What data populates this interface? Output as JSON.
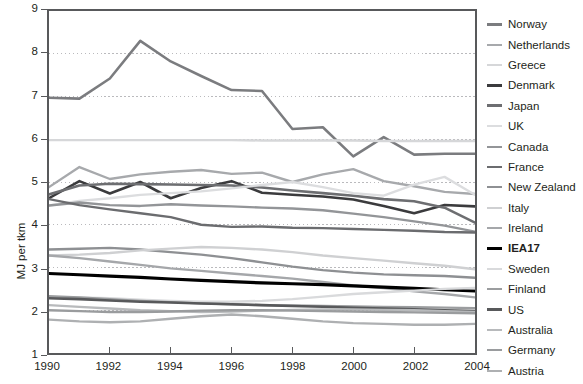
{
  "chart_data": {
    "type": "line",
    "title": "",
    "xlabel": "",
    "ylabel": "MJ per tkm",
    "xlim": [
      1990,
      2004
    ],
    "ylim": [
      1,
      9
    ],
    "grid": true,
    "legend_position": "right",
    "x": [
      1990,
      1991,
      1992,
      1993,
      1994,
      1995,
      1996,
      1997,
      1998,
      1999,
      2000,
      2001,
      2002,
      2003,
      2004
    ],
    "y_ticks": [
      1,
      2,
      3,
      4,
      5,
      6,
      7,
      8,
      9
    ],
    "x_ticks": [
      1990,
      1992,
      1994,
      1996,
      1998,
      2000,
      2002,
      2004
    ],
    "series": [
      {
        "name": "Norway",
        "color": "#7b7c7f",
        "width": 2.6,
        "values": [
          6.97,
          6.95,
          7.42,
          8.3,
          7.82,
          7.48,
          7.15,
          7.13,
          6.24,
          6.28,
          5.6,
          6.05,
          5.64,
          5.66,
          5.66
        ]
      },
      {
        "name": "Netherlands",
        "color": "#a7a9ac",
        "width": 2.4,
        "values": [
          4.88,
          5.35,
          5.07,
          5.18,
          5.24,
          5.28,
          5.19,
          5.22,
          5.0,
          5.18,
          5.3,
          5.02,
          4.9,
          4.77,
          4.72
        ]
      },
      {
        "name": "Greece",
        "color": "#d6d7d9",
        "width": 2.4,
        "values": [
          5.98,
          5.98,
          5.98,
          5.98,
          5.98,
          5.98,
          5.98,
          5.97,
          5.97,
          5.97,
          5.97,
          5.96,
          5.96,
          5.96,
          5.96
        ]
      },
      {
        "name": "Denmark",
        "color": "#3b3b3d",
        "width": 2.6,
        "values": [
          4.62,
          5.02,
          4.73,
          5.0,
          4.62,
          4.86,
          5.02,
          4.75,
          4.7,
          4.66,
          4.59,
          4.44,
          4.27,
          4.46,
          4.43
        ]
      },
      {
        "name": "Japan",
        "color": "#6d6e71",
        "width": 2.6,
        "values": [
          4.71,
          4.92,
          4.96,
          4.95,
          4.94,
          4.93,
          4.92,
          4.87,
          4.8,
          4.74,
          4.68,
          4.6,
          4.55,
          4.4,
          4.05
        ]
      },
      {
        "name": "UK",
        "color": "#dcdddf",
        "width": 2.4,
        "values": [
          4.45,
          4.56,
          4.62,
          4.7,
          4.74,
          4.78,
          4.85,
          4.93,
          5.0,
          4.88,
          4.74,
          4.68,
          4.94,
          5.12,
          4.7
        ]
      },
      {
        "name": "Canada",
        "color": "#939598",
        "width": 2.4,
        "values": [
          4.45,
          4.52,
          4.46,
          4.44,
          4.48,
          4.45,
          4.43,
          4.4,
          4.38,
          4.34,
          4.26,
          4.18,
          4.08,
          3.98,
          3.84
        ]
      },
      {
        "name": "France",
        "color": "#6b6c6f",
        "width": 2.4,
        "values": [
          4.6,
          4.46,
          4.36,
          4.27,
          4.18,
          4.0,
          3.95,
          3.96,
          3.93,
          3.92,
          3.9,
          3.88,
          3.86,
          3.83,
          3.82
        ]
      },
      {
        "name": "New Zealand",
        "color": "#8e9093",
        "width": 2.4,
        "values": [
          3.42,
          3.44,
          3.46,
          3.42,
          3.36,
          3.3,
          3.22,
          3.12,
          3.02,
          2.94,
          2.88,
          2.84,
          2.82,
          2.8,
          2.76
        ]
      },
      {
        "name": "Italy",
        "color": "#cfd0d2",
        "width": 2.4,
        "values": [
          3.28,
          3.3,
          3.34,
          3.4,
          3.44,
          3.48,
          3.46,
          3.42,
          3.36,
          3.28,
          3.22,
          3.16,
          3.1,
          3.04,
          2.96
        ]
      },
      {
        "name": "Ireland",
        "color": "#a5a7aa",
        "width": 2.4,
        "values": [
          3.28,
          3.22,
          3.14,
          3.06,
          2.98,
          2.92,
          2.86,
          2.8,
          2.74,
          2.66,
          2.58,
          2.52,
          2.44,
          2.38,
          2.3
        ]
      },
      {
        "name": "IEA17",
        "color": "#000000",
        "width": 3.2,
        "values": [
          2.86,
          2.83,
          2.8,
          2.77,
          2.73,
          2.7,
          2.67,
          2.64,
          2.62,
          2.6,
          2.57,
          2.54,
          2.51,
          2.48,
          2.45
        ]
      },
      {
        "name": "Sweden",
        "color": "#d9dadc",
        "width": 2.4,
        "values": [
          2.3,
          2.3,
          2.28,
          2.25,
          2.22,
          2.2,
          2.2,
          2.22,
          2.26,
          2.32,
          2.38,
          2.42,
          2.46,
          2.5,
          2.52
        ]
      },
      {
        "name": "Finland",
        "color": "#9b9d9f",
        "width": 2.4,
        "values": [
          2.33,
          2.3,
          2.26,
          2.22,
          2.19,
          2.16,
          2.14,
          2.12,
          2.11,
          2.1,
          2.09,
          2.08,
          2.07,
          2.06,
          2.05
        ]
      },
      {
        "name": "US",
        "color": "#58595b",
        "width": 2.6,
        "values": [
          2.28,
          2.26,
          2.23,
          2.2,
          2.18,
          2.16,
          2.14,
          2.12,
          2.1,
          2.08,
          2.06,
          2.04,
          2.02,
          2.0,
          1.98
        ]
      },
      {
        "name": "Australia",
        "color": "#b8babc",
        "width": 2.4,
        "values": [
          2.12,
          2.08,
          2.04,
          2.0,
          1.98,
          1.96,
          1.97,
          1.99,
          2.01,
          2.02,
          2.02,
          2.01,
          2.0,
          1.98,
          1.96
        ]
      },
      {
        "name": "Germany",
        "color": "#9a9c9e",
        "width": 2.4,
        "values": [
          2.0,
          1.98,
          1.96,
          1.96,
          1.97,
          1.99,
          2.0,
          2.0,
          1.99,
          1.98,
          1.97,
          1.96,
          1.95,
          1.94,
          1.93
        ]
      },
      {
        "name": "Austria",
        "color": "#aeb0b2",
        "width": 2.4,
        "values": [
          1.78,
          1.74,
          1.72,
          1.74,
          1.8,
          1.86,
          1.9,
          1.86,
          1.8,
          1.74,
          1.7,
          1.68,
          1.66,
          1.66,
          1.68
        ]
      }
    ]
  },
  "axis": {
    "y_title": "MJ per tkm",
    "y_tick_labels": [
      "9",
      "8",
      "7",
      "6",
      "5",
      "4",
      "3",
      "2",
      "1"
    ],
    "x_tick_labels": [
      "1990",
      "1992",
      "1994",
      "1996",
      "1998",
      "2000",
      "2002",
      "2004"
    ]
  },
  "legend": {
    "items": [
      {
        "label": "Norway",
        "bold": false
      },
      {
        "label": "Netherlands",
        "bold": false
      },
      {
        "label": "Greece",
        "bold": false
      },
      {
        "label": "Denmark",
        "bold": false
      },
      {
        "label": "Japan",
        "bold": false
      },
      {
        "label": "UK",
        "bold": false
      },
      {
        "label": "Canada",
        "bold": false
      },
      {
        "label": "France",
        "bold": false
      },
      {
        "label": "New Zealand",
        "bold": false
      },
      {
        "label": "Italy",
        "bold": false
      },
      {
        "label": "Ireland",
        "bold": false
      },
      {
        "label": "IEA17",
        "bold": true
      },
      {
        "label": "Sweden",
        "bold": false
      },
      {
        "label": "Finland",
        "bold": false
      },
      {
        "label": "US",
        "bold": false
      },
      {
        "label": "Australia",
        "bold": false
      },
      {
        "label": "Germany",
        "bold": false
      },
      {
        "label": "Austria",
        "bold": false
      }
    ]
  },
  "colors": {
    "axis": "#58595b",
    "grid": "#b9b9bc",
    "text": "#231f20",
    "background": "#ffffff",
    "highlight_series": "#000000"
  }
}
